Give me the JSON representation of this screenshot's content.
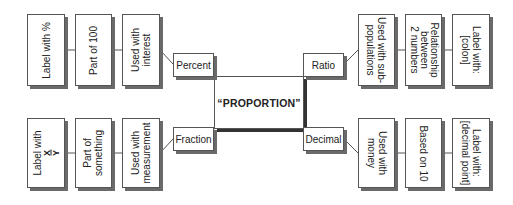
{
  "center": {
    "label": "“PROPORTION”"
  },
  "percent": {
    "label": "Percent",
    "chain": [
      "Used with\ninterest",
      "Part of 100",
      "Label with %"
    ]
  },
  "ratio": {
    "label": "Ratio",
    "chain": [
      "Used with sub-\npopulations",
      "Relationship\nbetween\n2 numbers",
      "Label with:\n[colon]"
    ]
  },
  "fraction": {
    "label": "Fraction",
    "chain": [
      "Used with\nmeasurement",
      "Part of\nsomething",
      "Label with"
    ],
    "fraction_symbol": {
      "numerator": "X",
      "denominator": "Y"
    }
  },
  "decimal": {
    "label": "Decimal",
    "chain": [
      "Used with\nmoney",
      "Based on 10",
      "Label with:\n[decimal point]"
    ]
  }
}
